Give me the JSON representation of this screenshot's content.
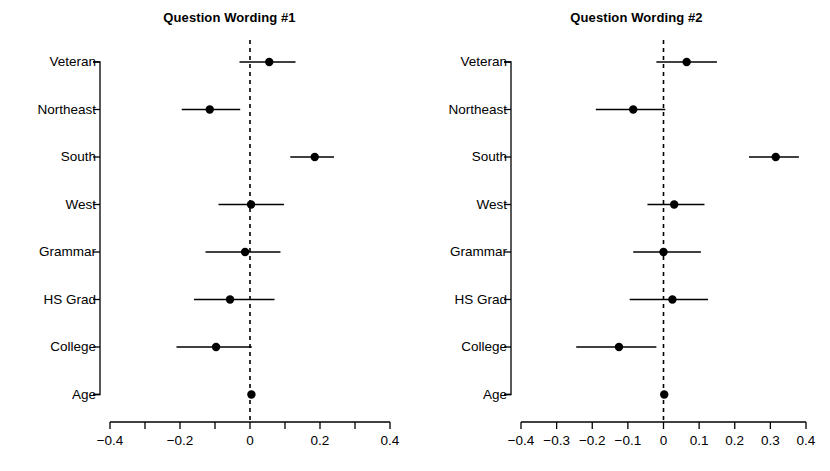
{
  "figure": {
    "background": "#ffffff",
    "foreground": "#000000",
    "width": 830,
    "height": 471
  },
  "chart_data": [
    {
      "type": "scatter",
      "subtype": "coefficient-forest-plot",
      "title": "Question Wording #1",
      "xlabel": "",
      "ylabel": "",
      "xlim": [
        -0.45,
        0.45
      ],
      "xticks": [
        -0.4,
        -0.3,
        -0.2,
        -0.1,
        0,
        0.1,
        0.2,
        0.3,
        0.4
      ],
      "xtick_labels": [
        "-0.4",
        "",
        "-0.2",
        "",
        "0",
        "",
        "0.2",
        "",
        "0.4"
      ],
      "grid": false,
      "legend": "none",
      "reference_line": {
        "x": 0,
        "style": "dashed"
      },
      "categories": [
        "Veteran",
        "Northeast",
        "South",
        "West",
        "Grammar",
        "HS Grad",
        "College",
        "Age"
      ],
      "values": [
        0.055,
        -0.115,
        0.185,
        0.003,
        -0.014,
        -0.057,
        -0.097,
        0.004
      ],
      "ci_low": [
        -0.03,
        -0.195,
        0.115,
        -0.09,
        -0.127,
        -0.16,
        -0.21,
        0.004
      ],
      "ci_high": [
        0.13,
        -0.028,
        0.24,
        0.097,
        0.087,
        0.07,
        0.005,
        0.004
      ]
    },
    {
      "type": "scatter",
      "subtype": "coefficient-forest-plot",
      "title": "Question Wording #2",
      "xlabel": "",
      "ylabel": "",
      "xlim": [
        -0.45,
        0.45
      ],
      "xticks": [
        -0.4,
        -0.3,
        -0.2,
        -0.1,
        0,
        0.1,
        0.2,
        0.3,
        0.4
      ],
      "xtick_labels": [
        "-0.4",
        "-0.3",
        "-0.2",
        "-0.1",
        "0",
        "0.1",
        "0.2",
        "0.3",
        "0.4"
      ],
      "grid": false,
      "legend": "none",
      "reference_line": {
        "x": 0,
        "style": "dashed"
      },
      "categories": [
        "Veteran",
        "Northeast",
        "South",
        "West",
        "Grammar",
        "HS Grad",
        "College",
        "Age"
      ],
      "values": [
        0.065,
        -0.085,
        0.315,
        0.03,
        0.0,
        0.025,
        -0.125,
        0.002
      ],
      "ci_low": [
        -0.02,
        -0.19,
        0.24,
        -0.045,
        -0.085,
        -0.095,
        -0.245,
        0.002
      ],
      "ci_high": [
        0.15,
        0.005,
        0.38,
        0.115,
        0.105,
        0.125,
        -0.02,
        0.002
      ]
    }
  ]
}
